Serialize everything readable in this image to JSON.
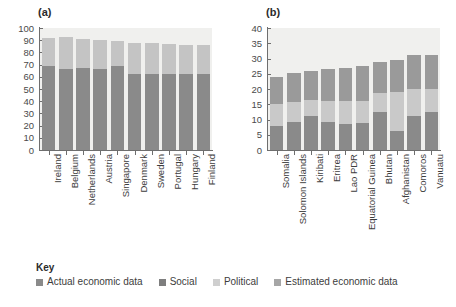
{
  "chart_data": [
    {
      "type": "bar",
      "panel": "(a)",
      "title": "(a)",
      "stacked": true,
      "xlabel": "",
      "ylabel": "",
      "ylim": [
        0,
        100
      ],
      "yticks": [
        100,
        90,
        80,
        70,
        60,
        50,
        40,
        30,
        20,
        10,
        0
      ],
      "grid": false,
      "legend_position": "bottom",
      "categories": [
        "Ireland",
        "Belgium",
        "Netherlands",
        "Austria",
        "Singapore",
        "Denmark",
        "Sweden",
        "Portugal",
        "Hungary",
        "Finland"
      ],
      "series": [
        {
          "name": "Actual economic data",
          "color": "#8a8a8a",
          "values": [
            69,
            66,
            67,
            66,
            69,
            62,
            62,
            62,
            62,
            62
          ]
        },
        {
          "name": "Political",
          "color": "#c4c4c4",
          "values": [
            23,
            26.5,
            24,
            24.5,
            20,
            26,
            26,
            25,
            24,
            24
          ]
        }
      ],
      "totals": [
        92,
        92.5,
        91,
        90.5,
        89,
        88,
        88,
        87,
        86,
        86
      ]
    },
    {
      "type": "bar",
      "panel": "(b)",
      "title": "(b)",
      "stacked": true,
      "xlabel": "",
      "ylabel": "",
      "ylim": [
        0,
        40
      ],
      "yticks": [
        40,
        35,
        30,
        25,
        20,
        15,
        10,
        5,
        0
      ],
      "grid": false,
      "legend_position": "bottom",
      "categories": [
        "Somalia",
        "Solomon Islands",
        "Kiribati",
        "Eritrea",
        "Lao PDR",
        "Equatorial Guinea",
        "Bhutan",
        "Afghanistan",
        "Comoros",
        "Vanuatu"
      ],
      "series": [
        {
          "name": "Estimated economic data",
          "color": "#8a8a8a",
          "values": [
            7.8,
            9.2,
            11,
            9.1,
            8.5,
            9,
            12.4,
            6.2,
            11,
            12.4
          ]
        },
        {
          "name": "Political",
          "color": "#c9c9c9",
          "values": [
            7.4,
            6.6,
            5.3,
            6.9,
            7.6,
            7.2,
            6.4,
            12.9,
            9,
            7.6
          ]
        },
        {
          "name": "Social",
          "color": "#9a9a9a",
          "values": [
            8.8,
            9.5,
            9.7,
            10.7,
            10.9,
            11.2,
            10.2,
            10.4,
            11,
            11
          ]
        }
      ],
      "totals": [
        24,
        25.3,
        26,
        26.7,
        27,
        27.4,
        29,
        29.5,
        31,
        31.2
      ]
    }
  ],
  "legend": {
    "title": "Key",
    "items": [
      {
        "label": "Actual economic data",
        "color": "#8a8a8a"
      },
      {
        "label": "Social",
        "color": "#7e7e7e"
      },
      {
        "label": "Political",
        "color": "#cfcfcf"
      },
      {
        "label": "Estimated economic data",
        "color": "#a6a6a6"
      }
    ]
  },
  "panels": {
    "a_label": "(a)",
    "b_label": "(b)"
  }
}
